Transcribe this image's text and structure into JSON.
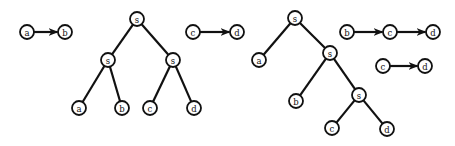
{
  "diagram": {
    "node_radius": 7,
    "colors": {
      "stroke": "#111111",
      "fill": "#ffffff"
    },
    "nodes": [
      {
        "id": "g1_a",
        "label": "a",
        "x": 27,
        "y": 32
      },
      {
        "id": "g1_b",
        "label": "b",
        "x": 65,
        "y": 32
      },
      {
        "id": "t1_s0",
        "label": "s",
        "x": 137,
        "y": 19
      },
      {
        "id": "t1_s1",
        "label": "s",
        "x": 108,
        "y": 60
      },
      {
        "id": "t1_s2",
        "label": "s",
        "x": 173,
        "y": 60
      },
      {
        "id": "t1_a",
        "label": "a",
        "x": 79,
        "y": 108
      },
      {
        "id": "t1_b",
        "label": "b",
        "x": 122,
        "y": 108
      },
      {
        "id": "t1_c",
        "label": "c",
        "x": 150,
        "y": 108
      },
      {
        "id": "t1_d",
        "label": "d",
        "x": 194,
        "y": 108
      },
      {
        "id": "g2_c",
        "label": "c",
        "x": 193,
        "y": 32
      },
      {
        "id": "g2_d",
        "label": "d",
        "x": 237,
        "y": 32
      },
      {
        "id": "t2_s0",
        "label": "s",
        "x": 295,
        "y": 18
      },
      {
        "id": "t2_a",
        "label": "a",
        "x": 259,
        "y": 60
      },
      {
        "id": "t2_s1",
        "label": "s",
        "x": 330,
        "y": 53
      },
      {
        "id": "t2_b",
        "label": "b",
        "x": 296,
        "y": 101
      },
      {
        "id": "t2_s2",
        "label": "s",
        "x": 359,
        "y": 95
      },
      {
        "id": "t2_c",
        "label": "c",
        "x": 332,
        "y": 128
      },
      {
        "id": "t2_d",
        "label": "d",
        "x": 387,
        "y": 129
      },
      {
        "id": "g3_b",
        "label": "b",
        "x": 347,
        "y": 32
      },
      {
        "id": "g3_c",
        "label": "c",
        "x": 390,
        "y": 32
      },
      {
        "id": "g3_d",
        "label": "d",
        "x": 433,
        "y": 32
      },
      {
        "id": "g4_c",
        "label": "c",
        "x": 383,
        "y": 66
      },
      {
        "id": "g4_d",
        "label": "d",
        "x": 425,
        "y": 66
      }
    ],
    "edges": [
      {
        "from": "g1_a",
        "to": "g1_b",
        "directed": true
      },
      {
        "from": "t1_s0",
        "to": "t1_s1",
        "directed": false
      },
      {
        "from": "t1_s0",
        "to": "t1_s2",
        "directed": false
      },
      {
        "from": "t1_s1",
        "to": "t1_a",
        "directed": false
      },
      {
        "from": "t1_s1",
        "to": "t1_b",
        "directed": false
      },
      {
        "from": "t1_s2",
        "to": "t1_c",
        "directed": false
      },
      {
        "from": "t1_s2",
        "to": "t1_d",
        "directed": false
      },
      {
        "from": "g2_c",
        "to": "g2_d",
        "directed": true
      },
      {
        "from": "t2_s0",
        "to": "t2_a",
        "directed": false
      },
      {
        "from": "t2_s0",
        "to": "t2_s1",
        "directed": false
      },
      {
        "from": "t2_s1",
        "to": "t2_b",
        "directed": false
      },
      {
        "from": "t2_s1",
        "to": "t2_s2",
        "directed": false
      },
      {
        "from": "t2_s2",
        "to": "t2_c",
        "directed": false
      },
      {
        "from": "t2_s2",
        "to": "t2_d",
        "directed": false
      },
      {
        "from": "g3_b",
        "to": "g3_c",
        "directed": true
      },
      {
        "from": "g3_c",
        "to": "g3_d",
        "directed": true
      },
      {
        "from": "g4_c",
        "to": "g4_d",
        "directed": true
      }
    ]
  }
}
